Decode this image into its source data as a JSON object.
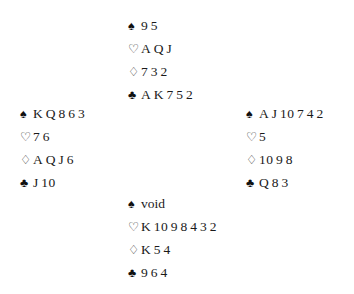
{
  "diagram": {
    "type": "bridge-deal",
    "background_color": "#ffffff",
    "text_color": "#1a1a1a",
    "suit_symbols": {
      "spades": "♠",
      "hearts": "♡",
      "diamonds": "♢",
      "clubs": "♣"
    },
    "suit_order": [
      "spades",
      "hearts",
      "diamonds",
      "clubs"
    ],
    "void_label": "void"
  },
  "hands": {
    "north": {
      "position": "north",
      "spades": "9 5",
      "hearts": "A Q J",
      "diamonds": "7 3 2",
      "clubs": "A K 7 5 2"
    },
    "west": {
      "position": "west",
      "spades": "K Q 8 6 3",
      "hearts": "7 6",
      "diamonds": "A Q J 6",
      "clubs": "J 10"
    },
    "east": {
      "position": "east",
      "spades": "A J 10 7 4 2",
      "hearts": "5",
      "diamonds": "10 9 8",
      "clubs": "Q 8 3"
    },
    "south": {
      "position": "south",
      "spades": "void",
      "hearts": "K 10 9 8 4 3 2",
      "diamonds": "K 5 4",
      "clubs": "9 6 4"
    }
  }
}
